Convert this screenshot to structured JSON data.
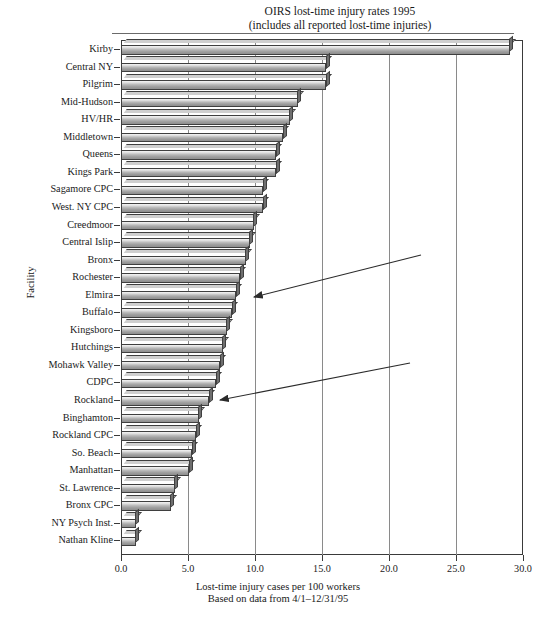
{
  "title": {
    "line1": "OIRS lost-time injury rates 1995",
    "line2": "(includes all reported lost-time injuries)"
  },
  "axes": {
    "y_title": "Facility",
    "x_caption_line1": "Lost-time  injury cases per 100 workers",
    "x_caption_line2": "Based on data from 4/1–12/31/95",
    "x_ticks": [
      "0.0",
      "5.0",
      "10.0",
      "15.0",
      "20.0",
      "25.0",
      "30.0"
    ]
  },
  "annotations": [
    {
      "name": "arrow-to-elmira",
      "target": "Elmira"
    },
    {
      "name": "arrow-to-rockland",
      "target": "Rockland"
    }
  ],
  "bottom_caption": "",
  "colors": {
    "bar_fill_light": "#f4f4f4",
    "bar_fill_dark": "#8e8e8e",
    "bar_outline": "#3f3f3f",
    "gridline": "#8a8a8a",
    "frame": "#3a3a3a"
  },
  "chart_data": {
    "type": "bar",
    "orientation": "horizontal",
    "title": "OIRS lost-time injury rates 1995 (includes all reported lost-time injuries)",
    "xlabel": "Lost-time  injury cases per 100 workers",
    "ylabel": "Facility",
    "xlim": [
      0.0,
      30.0
    ],
    "xticks": [
      0.0,
      5.0,
      10.0,
      15.0,
      20.0,
      25.0,
      30.0
    ],
    "grid": "vertical",
    "legend": "none",
    "categories": [
      "Kirby",
      "Central NY",
      "Pilgrim",
      "Mid-Hudson",
      "HV/HR",
      "Middletown",
      "Queens",
      "Kings Park",
      "Sagamore CPC",
      "West. NY CPC",
      "Creedmoor",
      "Central Islip",
      "Bronx",
      "Rochester",
      "Elmira",
      "Buffalo",
      "Kingsboro",
      "Hutchings",
      "Mohawk Valley",
      "CDPC",
      "Rockland",
      "Binghamton",
      "Rockland CPC",
      "So. Beach",
      "Manhattan",
      "St. Lawrence",
      "Bronx CPC",
      "NY Psych Inst.",
      "Nathan Kline"
    ],
    "values": [
      29.0,
      15.3,
      15.3,
      13.2,
      12.6,
      12.1,
      11.6,
      11.6,
      10.6,
      10.6,
      9.9,
      9.6,
      9.3,
      8.9,
      8.6,
      8.3,
      7.9,
      7.6,
      7.4,
      7.1,
      6.6,
      5.8,
      5.6,
      5.3,
      5.1,
      4.0,
      3.7,
      1.1,
      1.1
    ]
  }
}
